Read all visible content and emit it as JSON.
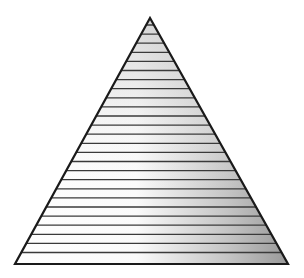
{
  "figure": {
    "shape": "triangle",
    "apex": [
      150,
      18
    ],
    "base_left": [
      15,
      264
    ],
    "base_right": [
      288,
      264
    ],
    "stripe_count": 26,
    "first_stripe_y": 25,
    "stripe_spacing": 9.1,
    "colors": {
      "outline": "#1a1a1a",
      "stripe": "#3a3a3a",
      "fill_light": "#ffffff",
      "fill_top": "#d6d6d6",
      "fill_dark": "#8e8e8e"
    }
  }
}
